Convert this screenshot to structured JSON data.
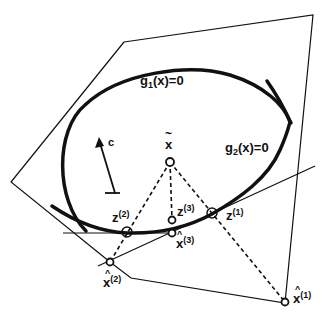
{
  "diagram": {
    "labels": {
      "g1": "g",
      "g1_sub": "1",
      "g1_rest": "(x)=0",
      "g2": "g",
      "g2_sub": "2",
      "g2_rest": "(x)=0",
      "c": "c",
      "x_tilde": "x",
      "x_tilde_accent": "~",
      "z1": "z",
      "z1_sup": "(1)",
      "z2": "z",
      "z2_sup": "(2)",
      "z3": "z",
      "z3_sup": "(3)",
      "xhat1": "x",
      "xhat1_sup": "(1)",
      "xhat2": "x",
      "xhat2_sup": "(2)",
      "xhat3": "x",
      "xhat3_sup": "(3)",
      "hat": "^"
    },
    "colors": {
      "stroke": "#111111",
      "background": "#ffffff"
    }
  }
}
